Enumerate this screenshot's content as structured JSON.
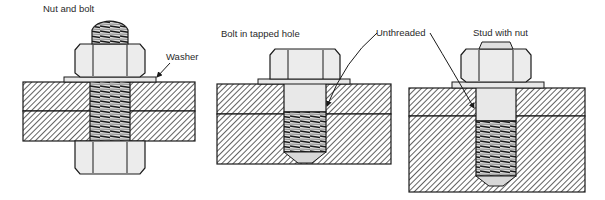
{
  "figure": {
    "panels": [
      {
        "title": "Nut and bolt",
        "callouts": [
          "Washer"
        ]
      },
      {
        "title": "Bolt in tapped hole"
      },
      {
        "title": "Stud with nut"
      }
    ],
    "shared_callout": "Unthreaded",
    "colors": {
      "line": "#1a1a1a",
      "hatch": "#3a3a3a",
      "metal": "#e8e8e8",
      "background": "#ffffff"
    }
  }
}
